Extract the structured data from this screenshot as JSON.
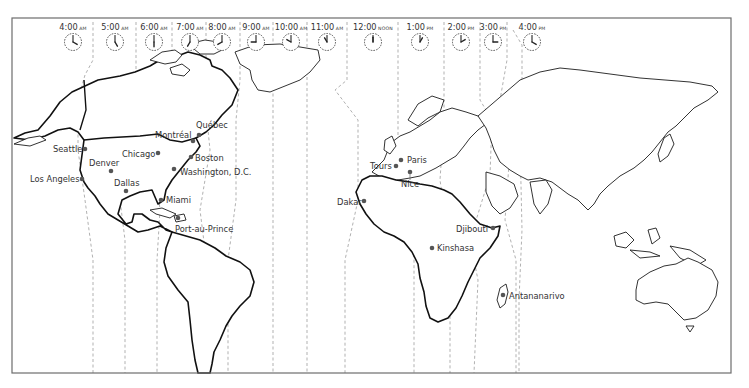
{
  "map": {
    "title": "World time zones map",
    "frame": {
      "x": 12,
      "y": 18,
      "width": 719,
      "height": 355,
      "stroke": "#6d6d6d"
    },
    "colors": {
      "land_fill": "#ffffff",
      "coastline": "#1c1c1c",
      "timezone_line": "#a8a8a8",
      "city_dot": "#555555",
      "text": "#333333"
    }
  },
  "clocks": [
    {
      "id": "c4am",
      "time": "4:00",
      "suffix": "AM",
      "hour": 4,
      "x": 73
    },
    {
      "id": "c5am",
      "time": "5:00",
      "suffix": "AM",
      "hour": 5,
      "x": 115
    },
    {
      "id": "c6am",
      "time": "6:00",
      "suffix": "AM",
      "hour": 6,
      "x": 154
    },
    {
      "id": "c7am",
      "time": "7:00",
      "suffix": "AM",
      "hour": 7,
      "x": 190
    },
    {
      "id": "c8am",
      "time": "8:00",
      "suffix": "AM",
      "hour": 8,
      "x": 222
    },
    {
      "id": "c9am",
      "time": "9:00",
      "suffix": "AM",
      "hour": 9,
      "x": 256
    },
    {
      "id": "c10am",
      "time": "10:00",
      "suffix": "AM",
      "hour": 10,
      "x": 291
    },
    {
      "id": "c11am",
      "time": "11:00",
      "suffix": "AM",
      "hour": 11,
      "x": 327
    },
    {
      "id": "c12",
      "time": "12:00",
      "suffix": "NOON",
      "hour": 12,
      "x": 373
    },
    {
      "id": "c1pm",
      "time": "1:00",
      "suffix": "PM",
      "hour": 1,
      "x": 420
    },
    {
      "id": "c2pm",
      "time": "2:00",
      "suffix": "PM",
      "hour": 2,
      "x": 461
    },
    {
      "id": "c3pm",
      "time": "3:00",
      "suffix": "PM",
      "hour": 3,
      "x": 493
    },
    {
      "id": "c4pm",
      "time": "4:00",
      "suffix": "PM",
      "hour": 4,
      "x": 532
    }
  ],
  "cities": [
    {
      "name": "Seattle",
      "dot": [
        85,
        149
      ],
      "label": [
        53,
        152
      ],
      "anchor": "start"
    },
    {
      "name": "Denver",
      "dot": [
        111,
        171
      ],
      "label": [
        89,
        166
      ],
      "anchor": "start"
    },
    {
      "name": "Los Angeles",
      "dot": [
        82,
        179
      ],
      "label": [
        30,
        182
      ],
      "anchor": "start"
    },
    {
      "name": "Chicago",
      "dot": [
        158,
        153
      ],
      "label": [
        122,
        157
      ],
      "anchor": "start"
    },
    {
      "name": "Dallas",
      "dot": [
        126,
        191
      ],
      "label": [
        114,
        186
      ],
      "anchor": "start"
    },
    {
      "name": "Montréal",
      "dot": [
        193,
        141
      ],
      "label": [
        155,
        138
      ],
      "anchor": "start"
    },
    {
      "name": "Québec",
      "dot": [
        199,
        135
      ],
      "label": [
        196,
        128
      ],
      "anchor": "start"
    },
    {
      "name": "Boston",
      "dot": [
        191,
        157
      ],
      "label": [
        195,
        161
      ],
      "anchor": "start"
    },
    {
      "name": "Washington, D.C.",
      "dot": [
        174,
        169
      ],
      "label": [
        180,
        175
      ],
      "anchor": "start"
    },
    {
      "name": "Miami",
      "dot": [
        161,
        200
      ],
      "label": [
        166,
        203
      ],
      "anchor": "start"
    },
    {
      "name": "Port-au-Prince",
      "dot": [
        178,
        218
      ],
      "label": [
        175,
        232
      ],
      "anchor": "start"
    },
    {
      "name": "Tours",
      "dot": [
        396,
        166
      ],
      "label": [
        370,
        169
      ],
      "anchor": "start"
    },
    {
      "name": "Paris",
      "dot": [
        401,
        160
      ],
      "label": [
        407,
        163
      ],
      "anchor": "start"
    },
    {
      "name": "Nice",
      "dot": [
        410,
        172
      ],
      "label": [
        401,
        187
      ],
      "anchor": "start"
    },
    {
      "name": "Dakar",
      "dot": [
        364,
        201
      ],
      "label": [
        337,
        205
      ],
      "anchor": "start"
    },
    {
      "name": "Djibouti",
      "dot": [
        493,
        228
      ],
      "label": [
        456,
        232
      ],
      "anchor": "start"
    },
    {
      "name": "Kinshasa",
      "dot": [
        432,
        248
      ],
      "label": [
        437,
        251
      ],
      "anchor": "start"
    },
    {
      "name": "Antananarivo",
      "dot": [
        503,
        295
      ],
      "label": [
        509,
        299
      ],
      "anchor": "start"
    }
  ]
}
